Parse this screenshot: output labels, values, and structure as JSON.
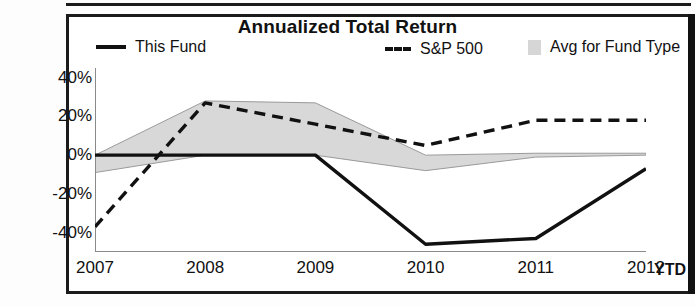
{
  "title": "Annualized Total Return",
  "legend": [
    {
      "label": "This Fund",
      "marker": "solid-line-swatch"
    },
    {
      "label": "S&P 500",
      "marker": "dashed-line-swatch"
    },
    {
      "label": "Avg for Fund Type",
      "marker": "shaded-area-swatch"
    }
  ],
  "axis": {
    "x_ticks": [
      "2007",
      "2008",
      "2009",
      "2010",
      "2011",
      "2012"
    ],
    "x_suffix": "YTD",
    "y_ticks": [
      "40%",
      "20%",
      "0%",
      "-20%",
      "-40%"
    ]
  },
  "colors": {
    "line": "#111111",
    "band": "#d8d8d8",
    "band_edge": "#9a9a9a",
    "frame": "#1b1b1b",
    "background": "#ffffff"
  },
  "chart_data": {
    "type": "line",
    "title": "Annualized Total Return",
    "xlabel": "",
    "ylabel": "",
    "x": [
      2007,
      2008,
      2009,
      2010,
      2011,
      2012
    ],
    "xtick_labels": [
      "2007",
      "2008",
      "2009",
      "2010",
      "2011",
      "2012"
    ],
    "ytick_labels": [
      "40%",
      "20%",
      "0%",
      "-20%",
      "-40%"
    ],
    "ylim": [
      -50,
      45
    ],
    "yticks": [
      40,
      20,
      0,
      -20,
      -40
    ],
    "grid": false,
    "legend_position": "top",
    "series": [
      {
        "name": "This Fund",
        "style": "solid",
        "values": [
          0,
          0,
          0,
          -46,
          -43,
          -7
        ]
      },
      {
        "name": "S&P 500",
        "style": "dashed",
        "values": [
          -37,
          27,
          16,
          5,
          18,
          18
        ]
      },
      {
        "name": "Avg for Fund Type",
        "style": "band",
        "upper": [
          0,
          28,
          27,
          0,
          1,
          1
        ],
        "lower": [
          -9,
          0,
          0,
          -8,
          -1,
          0
        ]
      }
    ]
  }
}
